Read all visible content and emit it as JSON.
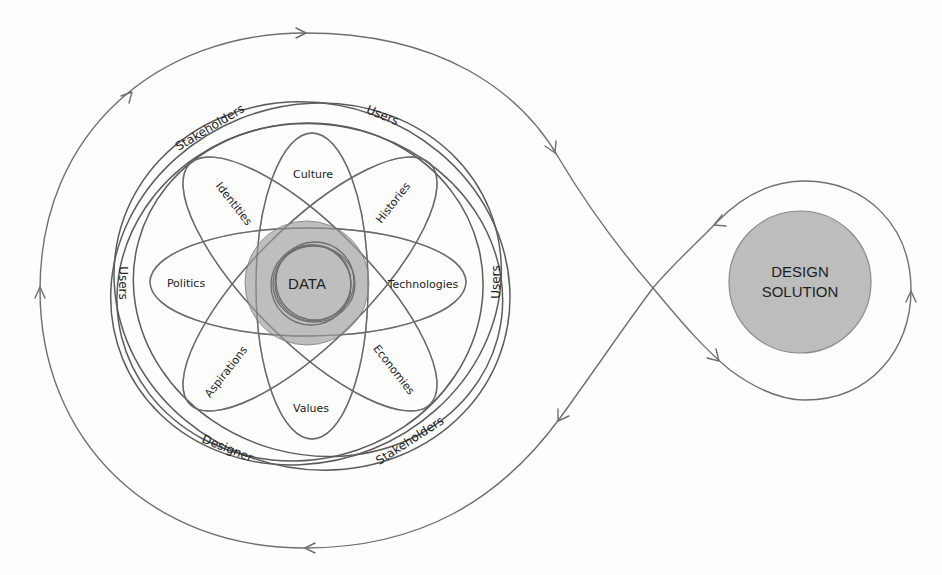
{
  "diagram": {
    "type": "design-process-loop",
    "colors": {
      "line": "#6f6f6f",
      "core_fill": "#b3b3b3",
      "solution_fill": "#bdbdbd",
      "background": "#fdfdfd"
    },
    "core": {
      "label": "DATA"
    },
    "petals": [
      {
        "id": "culture",
        "label": "Culture"
      },
      {
        "id": "histories",
        "label": "Histories"
      },
      {
        "id": "technologies",
        "label": "Technologies"
      },
      {
        "id": "economies",
        "label": "Economies"
      },
      {
        "id": "values",
        "label": "Values"
      },
      {
        "id": "aspirations",
        "label": "Aspirations"
      },
      {
        "id": "politics",
        "label": "Politics"
      },
      {
        "id": "identities",
        "label": "Identities"
      }
    ],
    "rings": [
      {
        "id": "stakeholders-top",
        "label": "Stakeholders"
      },
      {
        "id": "users-top",
        "label": "Users"
      },
      {
        "id": "users-left",
        "label": "Users"
      },
      {
        "id": "users-right",
        "label": "Users"
      },
      {
        "id": "designer-bottom",
        "label": "Designer"
      },
      {
        "id": "stakeholders-bottom",
        "label": "Stakeholders"
      }
    ],
    "solution": {
      "line1": "DESIGN",
      "line2": "SOLUTION"
    },
    "flow": {
      "description": "Figure-eight loop with arrows circulating from the context cluster to the design solution and back",
      "arrow_count": 8
    }
  }
}
